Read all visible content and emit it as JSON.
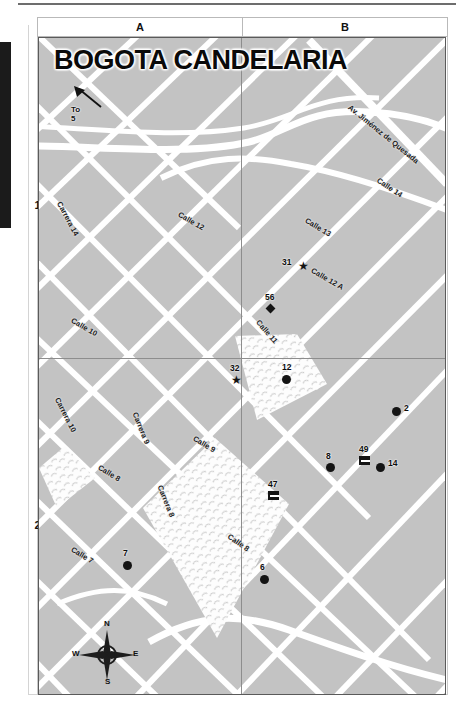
{
  "map": {
    "title": "BOGOTA CANDELARIA",
    "callout": {
      "label": "To 5",
      "icon": "arrow-up-left-icon"
    },
    "grid": {
      "columns": [
        "A",
        "B"
      ],
      "rows": [
        "1",
        "2"
      ]
    },
    "compass": {
      "north": "N",
      "south": "S",
      "east": "E",
      "west": "W",
      "icon": "compass-rose-icon"
    },
    "colors": {
      "land": "#c3c3c3",
      "road": "#ffffff",
      "frame": "#5a5a5a",
      "marker": "#141414",
      "label": "#1c1c1c"
    },
    "streets": [
      {
        "name": "Carrera 14",
        "x": 24,
        "y": 162,
        "rot": 62
      },
      {
        "name": "Calle 12",
        "x": 142,
        "y": 172,
        "rot": 30
      },
      {
        "name": "Calle 10",
        "x": 35,
        "y": 278,
        "rot": 30
      },
      {
        "name": "Av. Jiménez de Quesada",
        "x": 313,
        "y": 65,
        "rot": 39
      },
      {
        "name": "Calle 14",
        "x": 341,
        "y": 138,
        "rot": 33
      },
      {
        "name": "Calle 13",
        "x": 269,
        "y": 178,
        "rot": 31
      },
      {
        "name": "Calle 12 A",
        "x": 275,
        "y": 228,
        "rot": 30
      },
      {
        "name": "Calle 11",
        "x": 222,
        "y": 280,
        "rot": 49
      },
      {
        "name": "Carrera 10",
        "x": 22,
        "y": 358,
        "rot": 63
      },
      {
        "name": "Carrera 9",
        "x": 100,
        "y": 373,
        "rot": 68
      },
      {
        "name": "Calle 9",
        "x": 157,
        "y": 396,
        "rot": 31
      },
      {
        "name": "Calle 8",
        "x": 62,
        "y": 425,
        "rot": 31
      },
      {
        "name": "Carrera 8",
        "x": 125,
        "y": 446,
        "rot": 68
      },
      {
        "name": "Calle 7",
        "x": 35,
        "y": 507,
        "rot": 31
      },
      {
        "name": "Calle 8",
        "x": 192,
        "y": 494,
        "rot": 35
      }
    ],
    "markers": [
      {
        "id": "31",
        "type": "star",
        "x": 259,
        "y": 224
      },
      {
        "id": "56",
        "type": "diamond",
        "x": 228,
        "y": 267
      },
      {
        "id": "32",
        "type": "star",
        "x": 192,
        "y": 338
      },
      {
        "id": "12",
        "type": "dot",
        "x": 243,
        "y": 337
      },
      {
        "id": "2",
        "type": "dot",
        "x": 353,
        "y": 369
      },
      {
        "id": "49",
        "type": "bed",
        "x": 320,
        "y": 418
      },
      {
        "id": "8",
        "type": "dot",
        "x": 287,
        "y": 425
      },
      {
        "id": "14",
        "type": "dot",
        "x": 337,
        "y": 425
      },
      {
        "id": "47",
        "type": "bed",
        "x": 229,
        "y": 453
      },
      {
        "id": "7",
        "type": "dot",
        "x": 84,
        "y": 523
      },
      {
        "id": "6",
        "type": "dot",
        "x": 221,
        "y": 537
      }
    ]
  }
}
